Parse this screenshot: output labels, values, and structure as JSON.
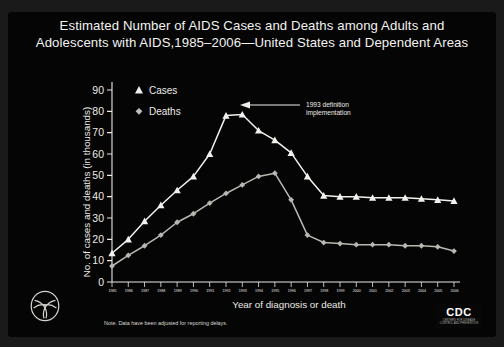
{
  "title": "Estimated Number of  AIDS Cases and Deaths among Adults and Adolescents with AIDS,1985–2006—United States and Dependent Areas",
  "annotation": {
    "line1": "1993 definition",
    "line2": "implementation"
  },
  "note": "Note. Data have been adjusted for reporting delays.",
  "legend": [
    {
      "label": "Cases",
      "marker": "triangle-marker"
    },
    {
      "label": "Deaths",
      "marker": "diamond-marker"
    }
  ],
  "logos": {
    "hhs": "hhs-seal-icon",
    "cdc_word": "CDC",
    "cdc_sub": "CENTERS FOR DISEASE CONTROL AND PREVENTION"
  },
  "chart_data": {
    "type": "line",
    "title": "Estimated Number of  AIDS Cases and Deaths among Adults and Adolescents with AIDS,1985–2006—United States and Dependent Areas",
    "xlabel": "Year of diagnosis or death",
    "ylabel": "No. of cases and deaths (in thousands)",
    "xlim": [
      1985,
      2006
    ],
    "ylim": [
      0,
      90
    ],
    "yticks": [
      0,
      10,
      20,
      30,
      40,
      50,
      60,
      70,
      80,
      90
    ],
    "grid": false,
    "legend_position": "top-left",
    "categories": [
      1985,
      1986,
      1987,
      1988,
      1989,
      1990,
      1991,
      1992,
      1993,
      1994,
      1995,
      1996,
      1997,
      1998,
      1999,
      2000,
      2001,
      2002,
      2003,
      2004,
      2005,
      2006
    ],
    "series": [
      {
        "name": "Cases",
        "marker": "triangle",
        "values": [
          13.5,
          20.0,
          28.5,
          36.0,
          43.0,
          49.5,
          60.0,
          78.0,
          78.5,
          71.0,
          66.5,
          60.5,
          49.5,
          40.5,
          40.0,
          40.0,
          39.5,
          39.5,
          39.5,
          39.0,
          38.5,
          38.0
        ]
      },
      {
        "name": "Deaths",
        "marker": "diamond",
        "values": [
          7.5,
          12.5,
          17.0,
          22.0,
          28.0,
          32.0,
          37.0,
          41.5,
          45.5,
          49.5,
          51.0,
          38.5,
          22.0,
          18.5,
          18.0,
          17.5,
          17.5,
          17.5,
          17.0,
          17.0,
          16.5,
          14.5
        ]
      }
    ]
  }
}
